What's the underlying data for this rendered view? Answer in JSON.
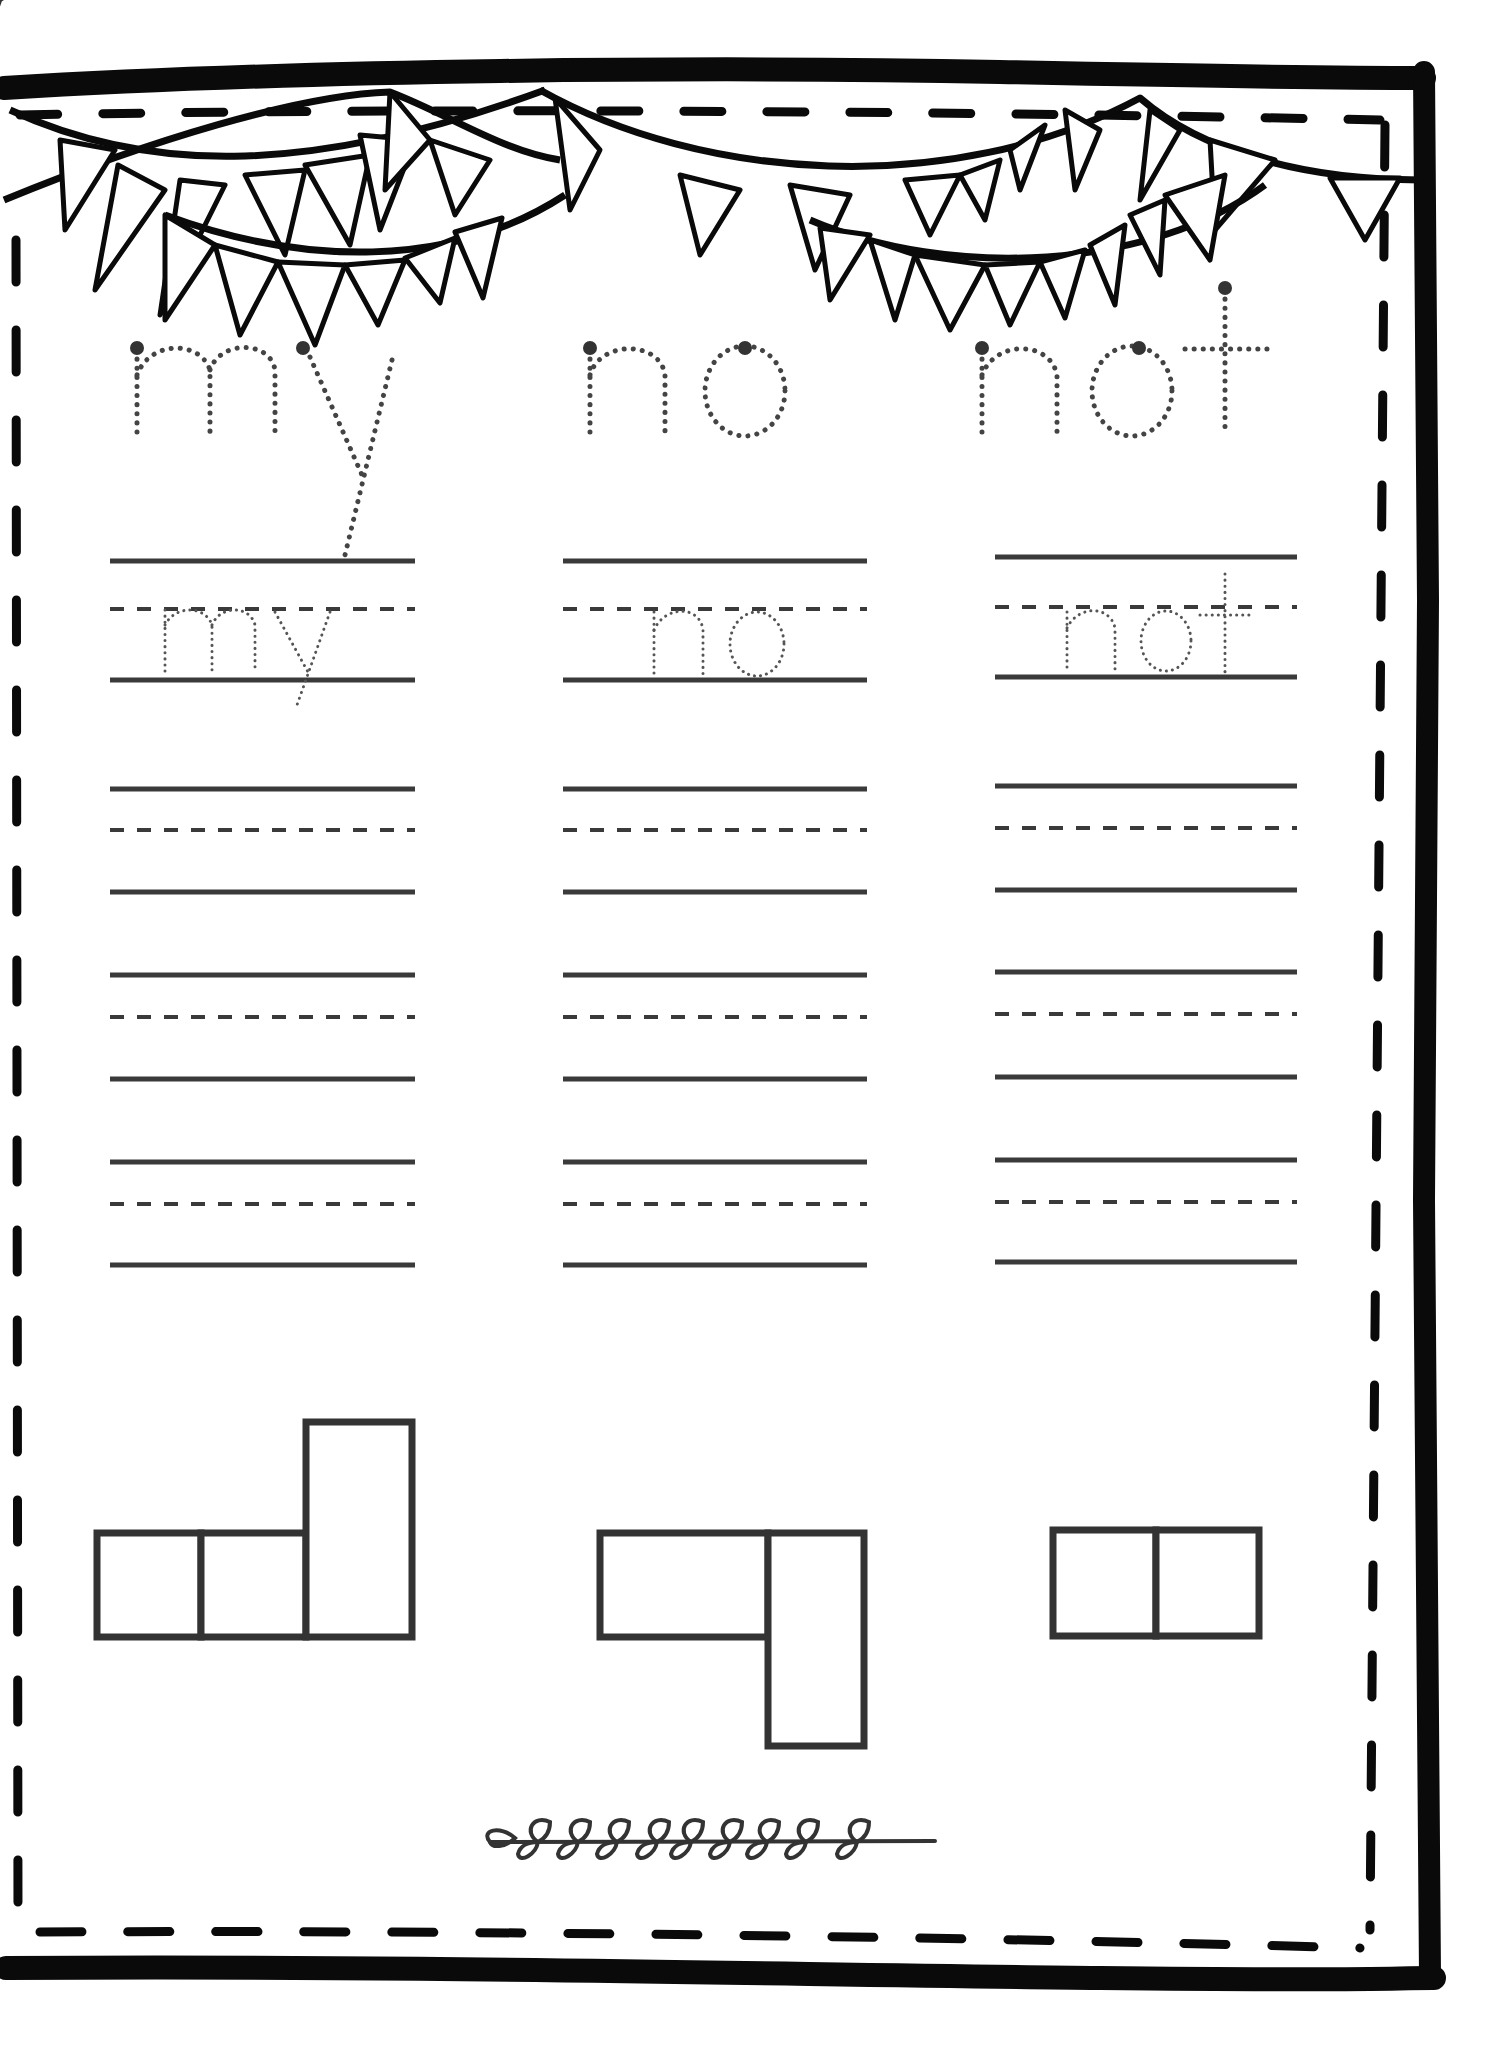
{
  "worksheet": {
    "type": "sight word practice",
    "colors": {
      "frame": "#0a0a0a",
      "lines": "#3a3a3a",
      "trace_dots": "#444444",
      "background": "#ffffff"
    },
    "columns": [
      {
        "word": "my",
        "trace_large": "my",
        "trace_small": "my",
        "blank_line_sets": 3,
        "word_shape": [
          "short",
          "short",
          "tall"
        ]
      },
      {
        "word": "no",
        "trace_large": "no",
        "trace_small": "no",
        "blank_line_sets": 3,
        "word_shape": [
          "short",
          "descender-right"
        ]
      },
      {
        "word": "not",
        "trace_large": "not",
        "trace_small": "not",
        "blank_line_sets": 3,
        "word_shape": [
          "short",
          "short"
        ]
      }
    ],
    "decorations": {
      "top": "bunting-garlands",
      "bottom": "leaf-vine"
    }
  }
}
